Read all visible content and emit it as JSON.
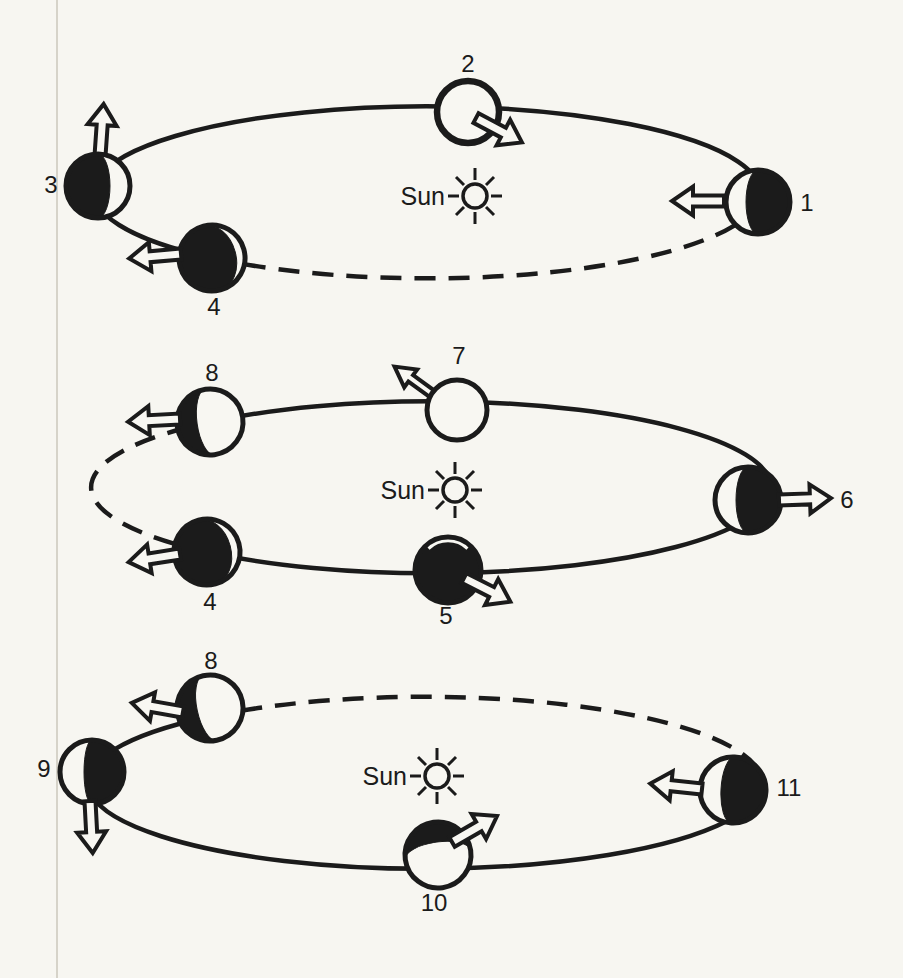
{
  "figure": {
    "background": "#f7f6f1",
    "ink": "#1b1b1b",
    "page_edge_line": "#d6d3c9",
    "description_of_marks": "three elliptical orbits around a Sun symbol, numbered planet positions with phase shading and open motion arrows"
  },
  "orbits": [
    {
      "sun_label": "Sun",
      "planets": [
        {
          "number": "1",
          "phase": "lit-crescent-left",
          "arrow": "left"
        },
        {
          "number": "2",
          "phase": "outline-circle",
          "arrow": "down-right"
        },
        {
          "number": "3",
          "phase": "lit-crescent-right",
          "arrow": "up"
        },
        {
          "number": "4",
          "phase": "thin-lit-crescent-right",
          "arrow": "left"
        }
      ]
    },
    {
      "sun_label": "Sun",
      "planets": [
        {
          "number": "8",
          "phase": "dark-crescent-left",
          "arrow": "left"
        },
        {
          "number": "7",
          "phase": "fully-lit",
          "arrow": "up-left"
        },
        {
          "number": "6",
          "phase": "lit-crescent-left",
          "arrow": "right"
        },
        {
          "number": "5",
          "phase": "fully-dark",
          "arrow": "down-right"
        },
        {
          "number": "4",
          "phase": "thin-lit-crescent-right",
          "arrow": "left"
        }
      ]
    },
    {
      "sun_label": "Sun",
      "planets": [
        {
          "number": "8",
          "phase": "dark-crescent-upper-left",
          "arrow": "up-left"
        },
        {
          "number": "9",
          "phase": "lit-left-half",
          "arrow": "down"
        },
        {
          "number": "10",
          "phase": "dark-crescent-top",
          "arrow": "up-right"
        },
        {
          "number": "11",
          "phase": "lit-crescent-left",
          "arrow": "left"
        }
      ]
    }
  ]
}
